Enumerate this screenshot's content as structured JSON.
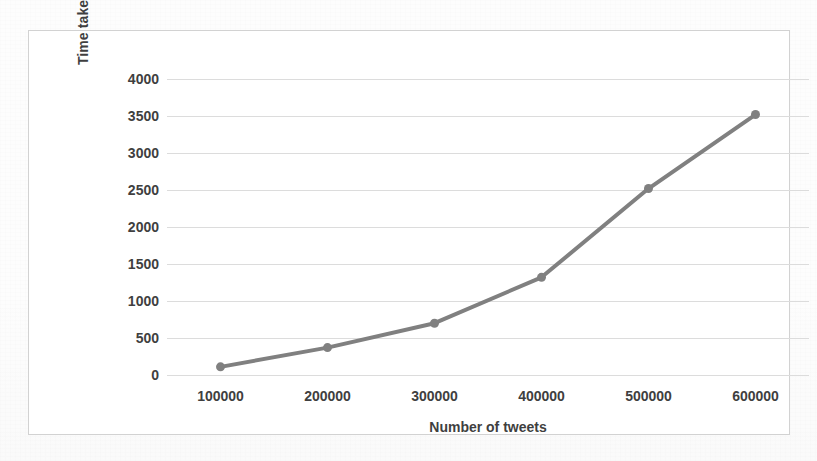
{
  "figure": {
    "background_color": "#fdfdfd",
    "frame_border_color": "#d2d2d2",
    "plot_background_color": "#ffffff"
  },
  "chart_data": {
    "type": "line",
    "title": "",
    "xlabel": "Number of tweets",
    "ylabel": "Time taken in second",
    "categories": [
      "100000",
      "200000",
      "300000",
      "400000",
      "500000",
      "600000"
    ],
    "x": [
      100000,
      200000,
      300000,
      400000,
      500000,
      600000
    ],
    "values": [
      110,
      370,
      700,
      1320,
      2520,
      3520
    ],
    "series": [
      {
        "name": "Time taken in second",
        "values": [
          110,
          370,
          700,
          1320,
          2520,
          3520
        ],
        "color": "#808080",
        "line_width": 4,
        "marker": "circle",
        "marker_size": 9
      }
    ],
    "ylim": [
      0,
      4000
    ],
    "ytick_labels": [
      "0",
      "500",
      "1000",
      "1500",
      "2000",
      "2500",
      "3000",
      "3500",
      "4000"
    ],
    "ytick_values": [
      0,
      500,
      1000,
      1500,
      2000,
      2500,
      3000,
      3500,
      4000
    ],
    "xtick_labels": [
      "100000",
      "200000",
      "300000",
      "400000",
      "500000",
      "600000"
    ],
    "grid": true,
    "grid_axis": "y",
    "grid_color": "#dcdcdc",
    "legend": false,
    "legend_position": "none"
  }
}
